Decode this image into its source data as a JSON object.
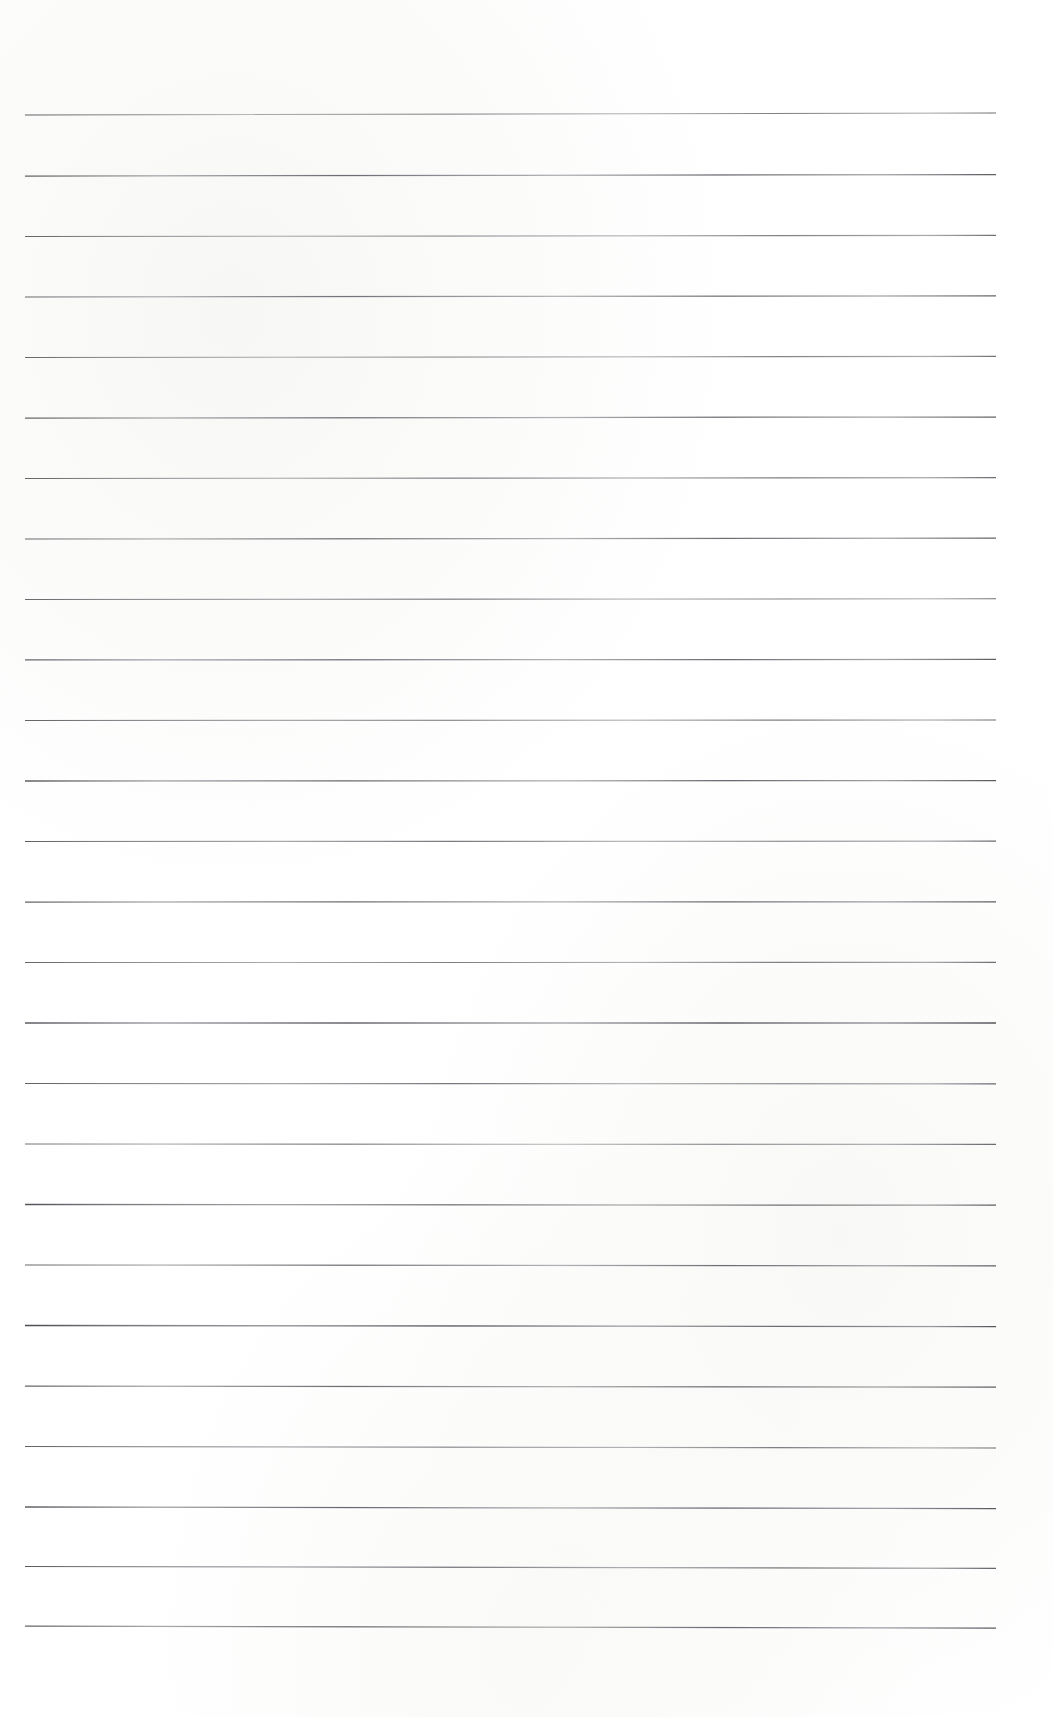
{
  "document": {
    "kind": "lined-notebook-page",
    "title": "Lined Notebook Page",
    "page_width": 1053,
    "page_height": 1717,
    "background_color": "#ffffff",
    "written_content": "",
    "visible_text": [],
    "header_text": "",
    "footer_text": "",
    "page_number": ""
  },
  "ruling": {
    "line_color": "#4e4e56",
    "line_color_light": "#7b7b84",
    "line_count": 26,
    "line_thickness_px": 1.25,
    "line_left_x": 25,
    "line_right_x": 996,
    "line_length_px": 971,
    "first_line_y": 115,
    "last_line_y": 1626,
    "line_spacing_px": 60.4,
    "top_margin_px": 115,
    "bottom_margin_px": 91,
    "left_margin_px": 25,
    "right_margin_px": 57,
    "margin_rule_present": false,
    "holes_present": false,
    "lines": [
      {
        "index": 1,
        "y_left": 115.0,
        "y_right": 113.0,
        "opacity": 0.8,
        "weight": 1.15
      },
      {
        "index": 2,
        "y_left": 176.0,
        "y_right": 174.6,
        "opacity": 0.86,
        "weight": 1.25
      },
      {
        "index": 3,
        "y_left": 236.5,
        "y_right": 235.4,
        "opacity": 0.78,
        "weight": 1.15
      },
      {
        "index": 4,
        "y_left": 297.0,
        "y_right": 295.8,
        "opacity": 0.82,
        "weight": 1.2
      },
      {
        "index": 5,
        "y_left": 357.5,
        "y_right": 356.4,
        "opacity": 0.76,
        "weight": 1.1
      },
      {
        "index": 6,
        "y_left": 418.0,
        "y_right": 417.0,
        "opacity": 0.84,
        "weight": 1.25
      },
      {
        "index": 7,
        "y_left": 478.5,
        "y_right": 477.6,
        "opacity": 0.79,
        "weight": 1.15
      },
      {
        "index": 8,
        "y_left": 539.0,
        "y_right": 538.2,
        "opacity": 0.83,
        "weight": 1.2
      },
      {
        "index": 9,
        "y_left": 599.5,
        "y_right": 598.8,
        "opacity": 0.77,
        "weight": 1.1
      },
      {
        "index": 10,
        "y_left": 660.0,
        "y_right": 659.4,
        "opacity": 0.85,
        "weight": 1.25
      },
      {
        "index": 11,
        "y_left": 720.5,
        "y_right": 720.0,
        "opacity": 0.8,
        "weight": 1.15
      },
      {
        "index": 12,
        "y_left": 781.0,
        "y_right": 780.6,
        "opacity": 0.88,
        "weight": 1.3
      },
      {
        "index": 13,
        "y_left": 841.5,
        "y_right": 841.2,
        "opacity": 0.81,
        "weight": 1.18
      },
      {
        "index": 14,
        "y_left": 902.0,
        "y_right": 901.8,
        "opacity": 0.86,
        "weight": 1.25
      },
      {
        "index": 15,
        "y_left": 962.5,
        "y_right": 962.4,
        "opacity": 0.79,
        "weight": 1.12
      },
      {
        "index": 16,
        "y_left": 1023.0,
        "y_right": 1023.0,
        "opacity": 0.9,
        "weight": 1.35
      },
      {
        "index": 17,
        "y_left": 1083.5,
        "y_right": 1083.8,
        "opacity": 0.82,
        "weight": 1.2
      },
      {
        "index": 18,
        "y_left": 1144.0,
        "y_right": 1144.4,
        "opacity": 0.78,
        "weight": 1.12
      },
      {
        "index": 19,
        "y_left": 1204.5,
        "y_right": 1205.2,
        "opacity": 0.87,
        "weight": 1.28
      },
      {
        "index": 20,
        "y_left": 1265.0,
        "y_right": 1265.8,
        "opacity": 0.84,
        "weight": 1.22
      },
      {
        "index": 21,
        "y_left": 1325.5,
        "y_right": 1326.6,
        "opacity": 0.91,
        "weight": 1.35
      },
      {
        "index": 22,
        "y_left": 1386.0,
        "y_right": 1387.2,
        "opacity": 0.85,
        "weight": 1.25
      },
      {
        "index": 23,
        "y_left": 1446.5,
        "y_right": 1448.0,
        "opacity": 0.8,
        "weight": 1.15
      },
      {
        "index": 24,
        "y_left": 1507.0,
        "y_right": 1508.6,
        "opacity": 0.88,
        "weight": 1.28
      },
      {
        "index": 25,
        "y_left": 1566.5,
        "y_right": 1568.4,
        "opacity": 0.83,
        "weight": 1.2
      },
      {
        "index": 26,
        "y_left": 1626.0,
        "y_right": 1628.2,
        "opacity": 0.86,
        "weight": 1.25
      }
    ]
  }
}
